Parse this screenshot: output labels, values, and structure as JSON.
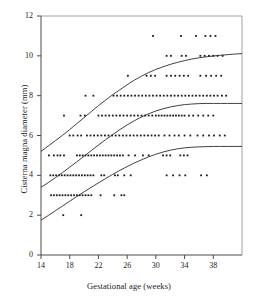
{
  "chart_data": {
    "type": "scatter",
    "title": "",
    "xlabel": "Gestational age (weeks)",
    "ylabel": "Cisterna magna diameter (mm)",
    "xlim": [
      14,
      42
    ],
    "ylim": [
      0,
      12
    ],
    "xticks": [
      14,
      18,
      22,
      26,
      30,
      34,
      38
    ],
    "yticks": [
      0,
      2,
      4,
      6,
      8,
      10,
      12
    ],
    "grid": false,
    "legend": "none",
    "marker": "small-square",
    "marker_color": "#1a1a1a",
    "curve_color": "#2b2b2b",
    "annotations": [],
    "series": [
      {
        "name": "97th centile curve",
        "type": "line",
        "x": [
          14,
          15,
          16,
          17,
          18,
          19,
          20,
          21,
          22,
          23,
          24,
          25,
          26,
          27,
          28,
          29,
          30,
          31,
          32,
          33,
          34,
          35,
          36,
          37,
          38,
          39,
          40,
          41,
          42
        ],
        "y": [
          5.2,
          5.47,
          5.74,
          6.01,
          6.3,
          6.6,
          6.9,
          7.2,
          7.5,
          7.78,
          8.05,
          8.3,
          8.55,
          8.78,
          8.98,
          9.16,
          9.32,
          9.45,
          9.57,
          9.67,
          9.76,
          9.84,
          9.9,
          9.95,
          9.99,
          10.03,
          10.06,
          10.09,
          10.11
        ]
      },
      {
        "name": "50th centile curve",
        "type": "line",
        "x": [
          14,
          15,
          16,
          17,
          18,
          19,
          20,
          21,
          22,
          23,
          24,
          25,
          26,
          27,
          28,
          29,
          30,
          31,
          32,
          33,
          34,
          35,
          36,
          37,
          38,
          39,
          40,
          41,
          42
        ],
        "y": [
          3.4,
          3.63,
          3.88,
          4.14,
          4.41,
          4.68,
          4.96,
          5.24,
          5.52,
          5.79,
          6.05,
          6.3,
          6.53,
          6.74,
          6.93,
          7.09,
          7.23,
          7.34,
          7.43,
          7.5,
          7.55,
          7.58,
          7.6,
          7.61,
          7.61,
          7.61,
          7.61,
          7.61,
          7.61
        ]
      },
      {
        "name": "3rd centile curve",
        "type": "line",
        "x": [
          14,
          15,
          16,
          17,
          18,
          19,
          20,
          21,
          22,
          23,
          24,
          25,
          26,
          27,
          28,
          29,
          30,
          31,
          32,
          33,
          34,
          35,
          36,
          37,
          38,
          39,
          40,
          41,
          42
        ],
        "y": [
          1.75,
          1.98,
          2.22,
          2.46,
          2.7,
          2.94,
          3.17,
          3.4,
          3.62,
          3.84,
          4.05,
          4.25,
          4.44,
          4.62,
          4.78,
          4.93,
          5.06,
          5.17,
          5.26,
          5.33,
          5.38,
          5.41,
          5.43,
          5.44,
          5.45,
          5.45,
          5.45,
          5.45,
          5.45
        ]
      },
      {
        "name": "Cisterna magna measurements",
        "type": "scatter",
        "points": [
          [
            17.1,
            2
          ],
          [
            19.6,
            2
          ],
          [
            15.4,
            3
          ],
          [
            15.8,
            3
          ],
          [
            16.2,
            3
          ],
          [
            16.6,
            3
          ],
          [
            17.0,
            3
          ],
          [
            17.4,
            3
          ],
          [
            17.8,
            3
          ],
          [
            18.2,
            3
          ],
          [
            18.6,
            3
          ],
          [
            19.0,
            3
          ],
          [
            19.4,
            3
          ],
          [
            19.8,
            3
          ],
          [
            20.2,
            3
          ],
          [
            20.6,
            3
          ],
          [
            21.0,
            3
          ],
          [
            22.3,
            3
          ],
          [
            24.2,
            3
          ],
          [
            25.2,
            3
          ],
          [
            25.6,
            3
          ],
          [
            15.3,
            4
          ],
          [
            15.7,
            4
          ],
          [
            16.1,
            4
          ],
          [
            16.5,
            4
          ],
          [
            16.9,
            4
          ],
          [
            17.3,
            4
          ],
          [
            17.7,
            4
          ],
          [
            18.1,
            4
          ],
          [
            18.5,
            4
          ],
          [
            18.9,
            4
          ],
          [
            19.3,
            4
          ],
          [
            19.7,
            4
          ],
          [
            20.1,
            4
          ],
          [
            20.5,
            4
          ],
          [
            20.9,
            4
          ],
          [
            21.3,
            4
          ],
          [
            22.4,
            4
          ],
          [
            22.8,
            4
          ],
          [
            24.3,
            4
          ],
          [
            24.7,
            4
          ],
          [
            25.6,
            4
          ],
          [
            26.5,
            4
          ],
          [
            31.5,
            4
          ],
          [
            32.4,
            4
          ],
          [
            33.3,
            4
          ],
          [
            34.1,
            4
          ],
          [
            36.3,
            4
          ],
          [
            37.1,
            4
          ],
          [
            15.1,
            5
          ],
          [
            15.8,
            5
          ],
          [
            16.3,
            5
          ],
          [
            16.7,
            5
          ],
          [
            17.2,
            5
          ],
          [
            19.0,
            5
          ],
          [
            19.4,
            5
          ],
          [
            19.8,
            5
          ],
          [
            20.2,
            5
          ],
          [
            20.6,
            5
          ],
          [
            21.0,
            5
          ],
          [
            21.4,
            5
          ],
          [
            21.8,
            5
          ],
          [
            22.2,
            5
          ],
          [
            22.6,
            5
          ],
          [
            23.0,
            5
          ],
          [
            23.4,
            5
          ],
          [
            23.8,
            5
          ],
          [
            24.2,
            5
          ],
          [
            24.6,
            5
          ],
          [
            25.0,
            5
          ],
          [
            25.4,
            5
          ],
          [
            26.2,
            5
          ],
          [
            27.1,
            5
          ],
          [
            28.2,
            5
          ],
          [
            29.0,
            5
          ],
          [
            31.0,
            5
          ],
          [
            31.5,
            5
          ],
          [
            32.0,
            5
          ],
          [
            33.4,
            5
          ],
          [
            33.9,
            5
          ],
          [
            34.4,
            5
          ],
          [
            18.0,
            6
          ],
          [
            18.5,
            6
          ],
          [
            19.1,
            6
          ],
          [
            19.6,
            6
          ],
          [
            20.4,
            6
          ],
          [
            20.9,
            6
          ],
          [
            21.4,
            6
          ],
          [
            21.9,
            6
          ],
          [
            22.4,
            6
          ],
          [
            22.9,
            6
          ],
          [
            23.4,
            6
          ],
          [
            23.9,
            6
          ],
          [
            24.4,
            6
          ],
          [
            24.9,
            6
          ],
          [
            25.4,
            6
          ],
          [
            25.9,
            6
          ],
          [
            26.4,
            6
          ],
          [
            26.9,
            6
          ],
          [
            27.4,
            6
          ],
          [
            27.9,
            6
          ],
          [
            28.4,
            6
          ],
          [
            28.9,
            6
          ],
          [
            29.4,
            6
          ],
          [
            29.9,
            6
          ],
          [
            30.4,
            6
          ],
          [
            31.2,
            6
          ],
          [
            31.9,
            6
          ],
          [
            32.6,
            6
          ],
          [
            33.2,
            6
          ],
          [
            34.0,
            6
          ],
          [
            34.8,
            6
          ],
          [
            35.8,
            6
          ],
          [
            36.6,
            6
          ],
          [
            37.4,
            6
          ],
          [
            38.1,
            6
          ],
          [
            38.9,
            6
          ],
          [
            39.6,
            6
          ],
          [
            17.2,
            7
          ],
          [
            19.5,
            7
          ],
          [
            20.1,
            7
          ],
          [
            22.0,
            7
          ],
          [
            22.5,
            7
          ],
          [
            23.0,
            7
          ],
          [
            23.5,
            7
          ],
          [
            24.0,
            7
          ],
          [
            24.5,
            7
          ],
          [
            25.0,
            7
          ],
          [
            25.5,
            7
          ],
          [
            26.0,
            7
          ],
          [
            26.5,
            7
          ],
          [
            27.0,
            7
          ],
          [
            27.5,
            7
          ],
          [
            28.0,
            7
          ],
          [
            28.5,
            7
          ],
          [
            29.0,
            7
          ],
          [
            29.5,
            7
          ],
          [
            30.0,
            7
          ],
          [
            30.4,
            7
          ],
          [
            30.8,
            7
          ],
          [
            31.2,
            7
          ],
          [
            31.6,
            7
          ],
          [
            32.0,
            7
          ],
          [
            32.4,
            7
          ],
          [
            32.8,
            7
          ],
          [
            33.2,
            7
          ],
          [
            33.6,
            7
          ],
          [
            34.0,
            7
          ],
          [
            34.6,
            7
          ],
          [
            35.2,
            7
          ],
          [
            35.9,
            7
          ],
          [
            36.6,
            7
          ],
          [
            37.3,
            7
          ],
          [
            38.0,
            7
          ],
          [
            20.2,
            8
          ],
          [
            21.3,
            8
          ],
          [
            24.1,
            8
          ],
          [
            24.6,
            8
          ],
          [
            25.1,
            8
          ],
          [
            25.6,
            8
          ],
          [
            26.1,
            8
          ],
          [
            26.6,
            8
          ],
          [
            27.1,
            8
          ],
          [
            27.6,
            8
          ],
          [
            28.1,
            8
          ],
          [
            28.6,
            8
          ],
          [
            29.1,
            8
          ],
          [
            29.6,
            8
          ],
          [
            30.1,
            8
          ],
          [
            30.6,
            8
          ],
          [
            31.1,
            8
          ],
          [
            31.6,
            8
          ],
          [
            32.1,
            8
          ],
          [
            32.6,
            8
          ],
          [
            33.1,
            8
          ],
          [
            33.6,
            8
          ],
          [
            34.1,
            8
          ],
          [
            34.6,
            8
          ],
          [
            35.1,
            8
          ],
          [
            35.6,
            8
          ],
          [
            36.1,
            8
          ],
          [
            36.6,
            8
          ],
          [
            37.1,
            8
          ],
          [
            37.6,
            8
          ],
          [
            38.1,
            8
          ],
          [
            38.6,
            8
          ],
          [
            39.2,
            8
          ],
          [
            39.8,
            8
          ],
          [
            26.1,
            9
          ],
          [
            28.7,
            9
          ],
          [
            29.3,
            9
          ],
          [
            29.9,
            9
          ],
          [
            31.5,
            9
          ],
          [
            32.1,
            9
          ],
          [
            32.7,
            9
          ],
          [
            33.3,
            9
          ],
          [
            33.9,
            9
          ],
          [
            34.5,
            9
          ],
          [
            36.2,
            9
          ],
          [
            37.0,
            9
          ],
          [
            37.7,
            9
          ],
          [
            38.4,
            9
          ],
          [
            39.1,
            9
          ],
          [
            31.5,
            10
          ],
          [
            32.1,
            10
          ],
          [
            33.6,
            10
          ],
          [
            34.2,
            10
          ],
          [
            36.2,
            10
          ],
          [
            36.8,
            10
          ],
          [
            37.4,
            10
          ],
          [
            38.0,
            10
          ],
          [
            38.6,
            10
          ],
          [
            39.3,
            10
          ],
          [
            29.6,
            11
          ],
          [
            33.5,
            11
          ],
          [
            35.6,
            11
          ],
          [
            36.9,
            11
          ],
          [
            37.6,
            11
          ],
          [
            38.3,
            11
          ]
        ]
      }
    ]
  }
}
